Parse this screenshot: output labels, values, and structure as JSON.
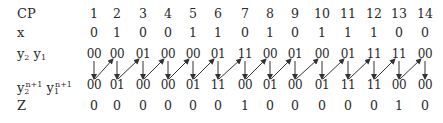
{
  "table": {
    "labels": {
      "cp": "CP",
      "x": "x",
      "present_state": {
        "y2": "y",
        "y2_sub": "2",
        "y1": "y",
        "y1_sub": "1"
      },
      "next_state": {
        "y2": "y",
        "y2_sub": "2",
        "y2_sup": "n+1",
        "y1": "y",
        "y1_sub": "1",
        "y1_sup": "n+1"
      },
      "z": "Z"
    },
    "cp": [
      "1",
      "2",
      "3",
      "4",
      "5",
      "6",
      "7",
      "8",
      "9",
      "10",
      "11",
      "12",
      "13",
      "14"
    ],
    "x": [
      "0",
      "1",
      "0",
      "0",
      "1",
      "1",
      "0",
      "1",
      "0",
      "1",
      "1",
      "1",
      "0",
      "0"
    ],
    "present_state": [
      "00",
      "00",
      "01",
      "00",
      "00",
      "01",
      "11",
      "00",
      "01",
      "00",
      "01",
      "11",
      "11",
      "00"
    ],
    "next_state": [
      "00",
      "01",
      "00",
      "00",
      "01",
      "11",
      "00",
      "01",
      "00",
      "01",
      "11",
      "11",
      "00",
      "00"
    ],
    "z": [
      "0",
      "0",
      "0",
      "0",
      "0",
      "0",
      "1",
      "0",
      "0",
      "0",
      "0",
      "0",
      "1",
      "0"
    ]
  },
  "colors": {
    "text": "#2a2a2a",
    "arrow": "#333333",
    "background": "#ffffff"
  }
}
